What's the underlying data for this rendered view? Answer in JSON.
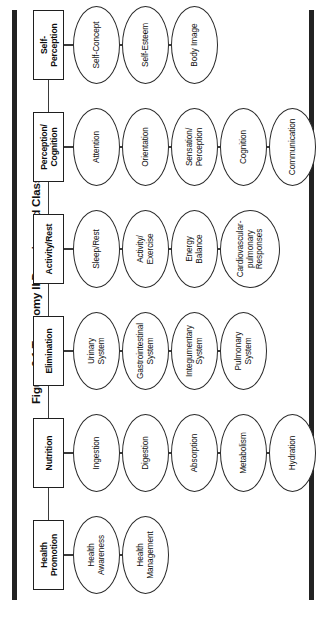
{
  "figure": {
    "title": "Figure 2.1  Taxonomy II Domains and Classes",
    "accent_color": "#222222",
    "line_color": "#3a3a3a",
    "box_border_color": "#1f1f1f",
    "oval_border_color": "#2a2a2a",
    "background": "#ffffff",
    "orientation": "rotated-90-ccw"
  },
  "domains": [
    {
      "id": "self-perception",
      "label": "Self-\nPerception",
      "label_lines": [
        "Self-",
        "Perception"
      ],
      "classes": [
        {
          "label_lines": [
            "Self-Concept"
          ]
        },
        {
          "label_lines": [
            "Self-Esteem"
          ]
        },
        {
          "label_lines": [
            "Body Image"
          ]
        }
      ]
    },
    {
      "id": "perception-cognition",
      "label": "Perception/\nCognition",
      "label_lines": [
        "Perception/",
        "Cognition"
      ],
      "classes": [
        {
          "label_lines": [
            "Attention"
          ]
        },
        {
          "label_lines": [
            "Orientation"
          ]
        },
        {
          "label_lines": [
            "Sensation/",
            "Perception"
          ]
        },
        {
          "label_lines": [
            "Cognition"
          ]
        },
        {
          "label_lines": [
            "Communication"
          ]
        }
      ]
    },
    {
      "id": "activity-rest",
      "label": "Activity/Rest",
      "label_lines": [
        "Activity/Rest"
      ],
      "classes": [
        {
          "label_lines": [
            "Sleep/Rest"
          ]
        },
        {
          "label_lines": [
            "Activity/",
            "Exercise"
          ]
        },
        {
          "label_lines": [
            "Energy",
            "Balance"
          ]
        },
        {
          "label_lines": [
            "Cardiovascular-",
            "pulmonary",
            "Responses"
          ],
          "wide": true
        }
      ]
    },
    {
      "id": "elimination",
      "label": "Elimination",
      "label_lines": [
        "Elimination"
      ],
      "classes": [
        {
          "label_lines": [
            "Urinary",
            "System"
          ]
        },
        {
          "label_lines": [
            "Gastrointestinal",
            "System"
          ]
        },
        {
          "label_lines": [
            "Integumentary",
            "System"
          ]
        },
        {
          "label_lines": [
            "Pulmonary",
            "System"
          ]
        }
      ]
    },
    {
      "id": "nutrition",
      "label": "Nutrition",
      "label_lines": [
        "Nutrition"
      ],
      "classes": [
        {
          "label_lines": [
            "Ingestion"
          ]
        },
        {
          "label_lines": [
            "Digestion"
          ]
        },
        {
          "label_lines": [
            "Absorption"
          ]
        },
        {
          "label_lines": [
            "Metabolism"
          ]
        },
        {
          "label_lines": [
            "Hydration"
          ]
        }
      ]
    },
    {
      "id": "health-promotion",
      "label": "Health\nPromotion",
      "label_lines": [
        "Health",
        "Promotion"
      ],
      "classes": [
        {
          "label_lines": [
            "Health",
            "Awareness"
          ]
        },
        {
          "label_lines": [
            "Health",
            "Management"
          ]
        }
      ]
    }
  ]
}
